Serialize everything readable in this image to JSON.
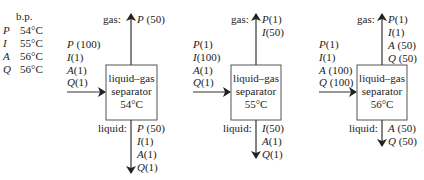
{
  "legend": {
    "header": "b.p.",
    "rows": [
      {
        "sym": "P",
        "temp": "54°C"
      },
      {
        "sym": "I",
        "temp": "55°C"
      },
      {
        "sym": "A",
        "temp": "56°C"
      },
      {
        "sym": "Q",
        "temp": "56°C"
      }
    ]
  },
  "labels": {
    "gas": "gas:",
    "liquid": "liquid:"
  },
  "separators": [
    {
      "line1": "liquid–gas",
      "line2": "separator",
      "temp": "54°C",
      "input": [
        {
          "sym": "P",
          "amt": "(100)"
        },
        {
          "sym": "I",
          "amt": "(1)"
        },
        {
          "sym": "A",
          "amt": "(1)"
        },
        {
          "sym": "Q",
          "amt": "(1)"
        }
      ],
      "gas": [
        {
          "sym": "P",
          "amt": "(50)"
        }
      ],
      "liquid": [
        {
          "sym": "P",
          "amt": "(50)"
        },
        {
          "sym": "I",
          "amt": "(1)"
        },
        {
          "sym": "A",
          "amt": "(1)"
        },
        {
          "sym": "Q",
          "amt": "(1)"
        }
      ]
    },
    {
      "line1": "liquid–gas",
      "line2": "separator",
      "temp": "55°C",
      "input": [
        {
          "sym": "P",
          "amt": "(1)"
        },
        {
          "sym": "I",
          "amt": "(100)"
        },
        {
          "sym": "A",
          "amt": "(1)"
        },
        {
          "sym": "Q",
          "amt": "(1)"
        }
      ],
      "gas": [
        {
          "sym": "P",
          "amt": "(1)"
        },
        {
          "sym": "I",
          "amt": "(50)"
        }
      ],
      "liquid": [
        {
          "sym": "I",
          "amt": "(50)"
        },
        {
          "sym": "A",
          "amt": "(1)"
        },
        {
          "sym": "Q",
          "amt": "(1)"
        }
      ]
    },
    {
      "line1": "liquid–gas",
      "line2": "separator",
      "temp": "56°C",
      "input": [
        {
          "sym": "P",
          "amt": "(1)"
        },
        {
          "sym": "I",
          "amt": "(1)"
        },
        {
          "sym": "A",
          "amt": "(100)"
        },
        {
          "sym": "Q",
          "amt": "(100)"
        }
      ],
      "gas": [
        {
          "sym": "P",
          "amt": "(1)"
        },
        {
          "sym": "I",
          "amt": "(1)"
        },
        {
          "sym": "A",
          "amt": "(50)"
        },
        {
          "sym": "Q",
          "amt": "(50)"
        }
      ],
      "liquid": [
        {
          "sym": "A",
          "amt": "(50)"
        },
        {
          "sym": "Q",
          "amt": "(50)"
        }
      ]
    }
  ]
}
